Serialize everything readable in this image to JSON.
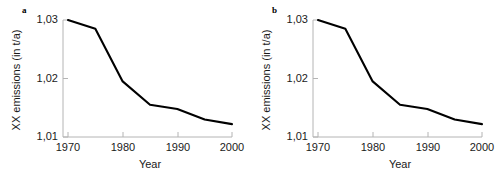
{
  "figure": {
    "background_color": "#ffffff",
    "line_color": "#000000",
    "axis_color": "#b4b4b4",
    "text_color": "#1a1a1a"
  },
  "panels": [
    {
      "label": "a",
      "chart_data": {
        "type": "line",
        "title": "",
        "xlabel": "Year",
        "ylabel": "XX emissions (in t/a)",
        "xlim": [
          1968,
          2001
        ],
        "ylim": [
          1.0095,
          1.0305
        ],
        "grid": false,
        "legend": null,
        "xticks": [
          1970,
          1980,
          1990,
          2000
        ],
        "xtick_labels": [
          "1970",
          "1980",
          "1990",
          "2000"
        ],
        "yticks": [
          1.01,
          1.02,
          1.03
        ],
        "ytick_labels": [
          "1,01",
          "1,02",
          "1,03"
        ],
        "decimal_separator": ",",
        "x": [
          1970,
          1975,
          1980,
          1985,
          1990,
          1995,
          2000
        ],
        "values": [
          1.03,
          1.0285,
          1.0195,
          1.0155,
          1.0148,
          1.013,
          1.0122
        ],
        "series": [
          {
            "name": "XX emissions",
            "values": [
              1.03,
              1.0285,
              1.0195,
              1.0155,
              1.0148,
              1.013,
              1.0122
            ]
          }
        ]
      }
    },
    {
      "label": "b",
      "chart_data": {
        "type": "line",
        "title": "",
        "xlabel": "Year",
        "ylabel": "XX emissions (in t/a)",
        "xlim": [
          1968,
          2001
        ],
        "ylim": [
          1.0095,
          1.0305
        ],
        "grid": false,
        "legend": null,
        "xticks": [
          1970,
          1980,
          1990,
          2000
        ],
        "xtick_labels": [
          "1970",
          "1980",
          "1990",
          "2000"
        ],
        "yticks": [
          1.01,
          1.02,
          1.03
        ],
        "ytick_labels": [
          "1,01",
          "1,02",
          "1,03"
        ],
        "decimal_separator": ",",
        "x": [
          1970,
          1975,
          1980,
          1985,
          1990,
          1995,
          2000
        ],
        "values": [
          1.03,
          1.0285,
          1.0195,
          1.0155,
          1.0148,
          1.013,
          1.0122
        ],
        "series": [
          {
            "name": "XX emissions",
            "values": [
              1.03,
              1.0285,
              1.0195,
              1.0155,
              1.0148,
              1.013,
              1.0122
            ]
          }
        ]
      }
    }
  ],
  "chart_data": [
    {
      "type": "line",
      "panel": "a",
      "title": "",
      "xlabel": "Year",
      "ylabel": "XX emissions (in t/a)",
      "xlim": [
        1968,
        2001
      ],
      "ylim": [
        1.0095,
        1.0305
      ],
      "grid": false,
      "xtick_labels": [
        "1970",
        "1980",
        "1990",
        "2000"
      ],
      "ytick_labels": [
        "1,01",
        "1,02",
        "1,03"
      ],
      "x": [
        1970,
        1975,
        1980,
        1985,
        1990,
        1995,
        2000
      ],
      "values": [
        1.03,
        1.0285,
        1.0195,
        1.0155,
        1.0148,
        1.013,
        1.0122
      ]
    },
    {
      "type": "line",
      "panel": "b",
      "title": "",
      "xlabel": "Year",
      "ylabel": "XX emissions (in t/a)",
      "xlim": [
        1968,
        2001
      ],
      "ylim": [
        1.0095,
        1.0305
      ],
      "grid": false,
      "xtick_labels": [
        "1970",
        "1980",
        "1990",
        "2000"
      ],
      "ytick_labels": [
        "1,01",
        "1,02",
        "1,03"
      ],
      "x": [
        1970,
        1975,
        1980,
        1985,
        1990,
        1995,
        2000
      ],
      "values": [
        1.03,
        1.0285,
        1.0195,
        1.0155,
        1.0148,
        1.013,
        1.0122
      ]
    }
  ]
}
